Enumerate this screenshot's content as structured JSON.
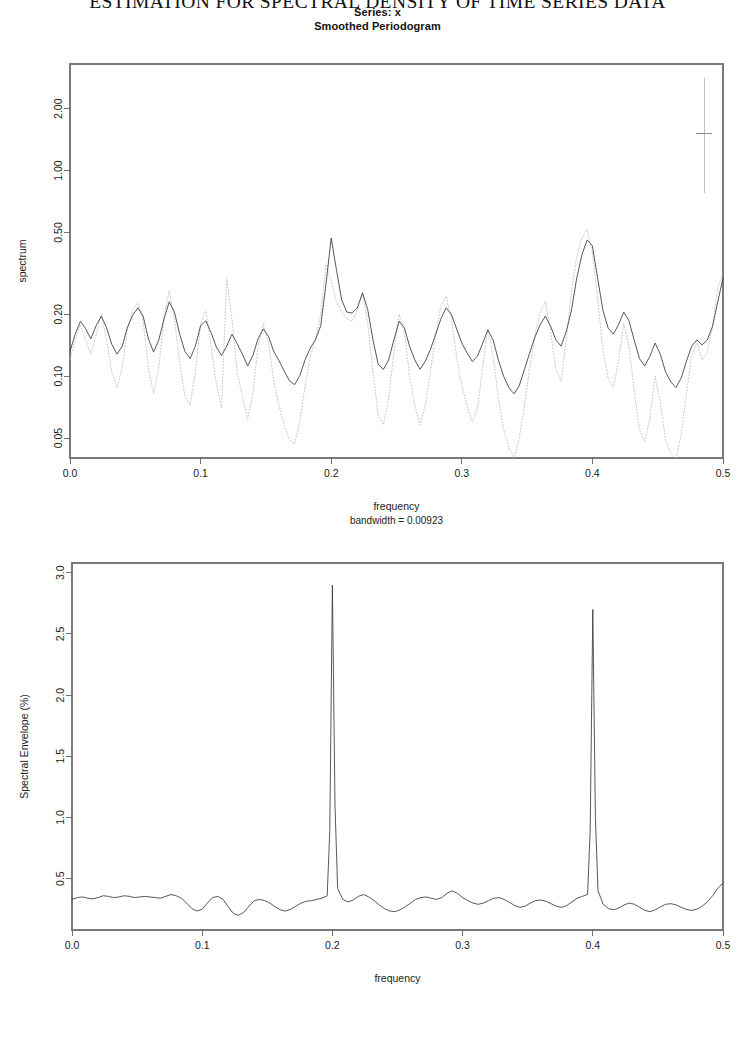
{
  "running_header": "ESTIMATION FOR SPECTRAL DENSITY OF TIME SERIES DATA",
  "figure_title": {
    "line1": "Series: x",
    "line2": "Smoothed Periodogram"
  },
  "chart_data": [
    {
      "id": "smoothed-periodogram",
      "type": "line",
      "title": "Series: x  /  Smoothed Periodogram",
      "xlabel": "frequency",
      "ylabel": "spectrum",
      "subnote": "bandwidth = 0.00923",
      "xlim": [
        0.0,
        0.5
      ],
      "xticks": [
        0.0,
        0.1,
        0.2,
        0.3,
        0.4,
        0.5
      ],
      "xtick_labels": [
        "0.0",
        "0.1",
        "0.2",
        "0.3",
        "0.4",
        "0.5"
      ],
      "yscale": "log",
      "ylim": [
        0.04,
        3.3
      ],
      "yticks": [
        2.0,
        1.0,
        0.5,
        0.2,
        0.1,
        0.05
      ],
      "ytick_labels": [
        "2.00",
        "1.00",
        "0.50",
        "0.20",
        "0.10",
        "0.05"
      ],
      "grid": false,
      "legend": "none",
      "confidence_bar": {
        "x": 0.4855,
        "lower": 0.78,
        "upper": 2.82,
        "center": 1.52
      },
      "series": [
        {
          "name": "smoothed spectrum",
          "style": "solid",
          "color": "#3a3a3a",
          "x": [
            0.0,
            0.004,
            0.008,
            0.012,
            0.016,
            0.02,
            0.024,
            0.028,
            0.032,
            0.036,
            0.04,
            0.044,
            0.048,
            0.052,
            0.056,
            0.06,
            0.064,
            0.068,
            0.072,
            0.076,
            0.08,
            0.084,
            0.088,
            0.092,
            0.096,
            0.1,
            0.104,
            0.108,
            0.112,
            0.116,
            0.12,
            0.124,
            0.128,
            0.132,
            0.136,
            0.14,
            0.144,
            0.148,
            0.152,
            0.156,
            0.16,
            0.164,
            0.168,
            0.172,
            0.176,
            0.18,
            0.184,
            0.188,
            0.192,
            0.196,
            0.2,
            0.204,
            0.208,
            0.212,
            0.216,
            0.22,
            0.224,
            0.228,
            0.232,
            0.236,
            0.24,
            0.244,
            0.248,
            0.252,
            0.256,
            0.26,
            0.264,
            0.268,
            0.272,
            0.276,
            0.28,
            0.284,
            0.288,
            0.292,
            0.296,
            0.3,
            0.304,
            0.308,
            0.312,
            0.316,
            0.32,
            0.324,
            0.328,
            0.332,
            0.336,
            0.34,
            0.344,
            0.348,
            0.352,
            0.356,
            0.36,
            0.364,
            0.368,
            0.372,
            0.376,
            0.38,
            0.384,
            0.388,
            0.392,
            0.396,
            0.4,
            0.404,
            0.408,
            0.412,
            0.416,
            0.42,
            0.424,
            0.428,
            0.432,
            0.436,
            0.44,
            0.444,
            0.448,
            0.452,
            0.456,
            0.46,
            0.464,
            0.468,
            0.472,
            0.476,
            0.48,
            0.484,
            0.488,
            0.492,
            0.496,
            0.5
          ],
          "y": [
            0.132,
            0.16,
            0.185,
            0.17,
            0.152,
            0.176,
            0.196,
            0.172,
            0.143,
            0.128,
            0.14,
            0.173,
            0.198,
            0.215,
            0.196,
            0.152,
            0.131,
            0.15,
            0.19,
            0.23,
            0.205,
            0.16,
            0.132,
            0.122,
            0.14,
            0.176,
            0.186,
            0.163,
            0.139,
            0.126,
            0.14,
            0.16,
            0.144,
            0.128,
            0.112,
            0.126,
            0.152,
            0.17,
            0.156,
            0.132,
            0.119,
            0.106,
            0.095,
            0.091,
            0.101,
            0.12,
            0.137,
            0.151,
            0.176,
            0.28,
            0.47,
            0.33,
            0.235,
            0.205,
            0.203,
            0.215,
            0.255,
            0.21,
            0.15,
            0.114,
            0.108,
            0.12,
            0.15,
            0.185,
            0.172,
            0.14,
            0.12,
            0.108,
            0.118,
            0.135,
            0.16,
            0.19,
            0.215,
            0.2,
            0.17,
            0.145,
            0.13,
            0.118,
            0.125,
            0.145,
            0.168,
            0.15,
            0.12,
            0.1,
            0.088,
            0.082,
            0.09,
            0.108,
            0.13,
            0.155,
            0.178,
            0.196,
            0.175,
            0.15,
            0.14,
            0.165,
            0.21,
            0.3,
            0.39,
            0.46,
            0.43,
            0.3,
            0.21,
            0.172,
            0.16,
            0.178,
            0.205,
            0.186,
            0.15,
            0.122,
            0.112,
            0.125,
            0.145,
            0.128,
            0.105,
            0.094,
            0.088,
            0.098,
            0.118,
            0.14,
            0.15,
            0.142,
            0.15,
            0.175,
            0.23,
            0.3
          ]
        },
        {
          "name": "raw periodogram",
          "style": "dotted",
          "color": "#b6b6b6",
          "x": [
            0.0,
            0.004,
            0.008,
            0.012,
            0.016,
            0.02,
            0.024,
            0.028,
            0.032,
            0.036,
            0.04,
            0.044,
            0.048,
            0.052,
            0.056,
            0.06,
            0.064,
            0.068,
            0.072,
            0.076,
            0.08,
            0.084,
            0.088,
            0.092,
            0.096,
            0.1,
            0.104,
            0.108,
            0.112,
            0.116,
            0.12,
            0.124,
            0.128,
            0.132,
            0.136,
            0.14,
            0.144,
            0.148,
            0.152,
            0.156,
            0.16,
            0.164,
            0.168,
            0.172,
            0.176,
            0.18,
            0.184,
            0.188,
            0.192,
            0.196,
            0.2,
            0.204,
            0.208,
            0.212,
            0.216,
            0.22,
            0.224,
            0.228,
            0.232,
            0.236,
            0.24,
            0.244,
            0.248,
            0.252,
            0.256,
            0.26,
            0.264,
            0.268,
            0.272,
            0.276,
            0.28,
            0.284,
            0.288,
            0.292,
            0.296,
            0.3,
            0.304,
            0.308,
            0.312,
            0.316,
            0.32,
            0.324,
            0.328,
            0.332,
            0.336,
            0.34,
            0.344,
            0.348,
            0.352,
            0.356,
            0.36,
            0.364,
            0.368,
            0.372,
            0.376,
            0.38,
            0.384,
            0.388,
            0.392,
            0.396,
            0.4,
            0.404,
            0.408,
            0.412,
            0.416,
            0.42,
            0.424,
            0.428,
            0.432,
            0.436,
            0.44,
            0.444,
            0.448,
            0.452,
            0.456,
            0.46,
            0.464,
            0.468,
            0.472,
            0.476,
            0.48,
            0.484,
            0.488,
            0.492,
            0.496,
            0.5
          ],
          "y": [
            0.12,
            0.15,
            0.178,
            0.15,
            0.128,
            0.16,
            0.2,
            0.15,
            0.105,
            0.088,
            0.11,
            0.17,
            0.21,
            0.23,
            0.185,
            0.11,
            0.082,
            0.11,
            0.195,
            0.26,
            0.19,
            0.115,
            0.08,
            0.072,
            0.105,
            0.18,
            0.21,
            0.14,
            0.092,
            0.07,
            0.3,
            0.19,
            0.105,
            0.08,
            0.062,
            0.082,
            0.14,
            0.18,
            0.145,
            0.095,
            0.072,
            0.058,
            0.049,
            0.047,
            0.06,
            0.09,
            0.125,
            0.15,
            0.2,
            0.35,
            0.29,
            0.23,
            0.205,
            0.19,
            0.185,
            0.21,
            0.25,
            0.18,
            0.105,
            0.065,
            0.058,
            0.078,
            0.13,
            0.2,
            0.165,
            0.1,
            0.072,
            0.058,
            0.072,
            0.105,
            0.16,
            0.22,
            0.245,
            0.19,
            0.125,
            0.09,
            0.072,
            0.06,
            0.07,
            0.11,
            0.17,
            0.125,
            0.078,
            0.055,
            0.045,
            0.04,
            0.05,
            0.072,
            0.11,
            0.158,
            0.205,
            0.23,
            0.165,
            0.108,
            0.095,
            0.15,
            0.26,
            0.38,
            0.47,
            0.52,
            0.4,
            0.24,
            0.135,
            0.098,
            0.088,
            0.118,
            0.18,
            0.14,
            0.085,
            0.055,
            0.048,
            0.062,
            0.1,
            0.075,
            0.049,
            0.042,
            0.04,
            0.052,
            0.082,
            0.125,
            0.145,
            0.12,
            0.13,
            0.175,
            0.27,
            0.32
          ]
        }
      ]
    },
    {
      "id": "spectral-envelope",
      "type": "line",
      "title": "",
      "xlabel": "frequency",
      "ylabel": "Spectral Envelope (%)",
      "xlim": [
        0.0,
        0.5
      ],
      "xticks": [
        0.0,
        0.1,
        0.2,
        0.3,
        0.4,
        0.5
      ],
      "xtick_labels": [
        "0.0",
        "0.1",
        "0.2",
        "0.3",
        "0.4",
        "0.5"
      ],
      "yscale": "linear",
      "ylim": [
        0.08,
        3.08
      ],
      "yticks": [
        0.5,
        1.0,
        1.5,
        2.0,
        2.5,
        3.0
      ],
      "ytick_labels": [
        "0.5",
        "1.0",
        "1.5",
        "2.0",
        "2.5",
        "3.0"
      ],
      "grid": false,
      "legend": "none",
      "peaks": [
        {
          "frequency": 0.2,
          "value": 2.9
        },
        {
          "frequency": 0.4,
          "value": 2.7
        }
      ],
      "series": [
        {
          "name": "spectral envelope",
          "style": "solid",
          "color": "#3a3a3a",
          "x": [
            0.0,
            0.004,
            0.008,
            0.012,
            0.016,
            0.02,
            0.024,
            0.028,
            0.032,
            0.036,
            0.04,
            0.044,
            0.048,
            0.052,
            0.056,
            0.06,
            0.064,
            0.068,
            0.072,
            0.076,
            0.08,
            0.084,
            0.088,
            0.092,
            0.096,
            0.1,
            0.104,
            0.108,
            0.112,
            0.116,
            0.12,
            0.124,
            0.128,
            0.132,
            0.136,
            0.14,
            0.144,
            0.148,
            0.152,
            0.156,
            0.16,
            0.164,
            0.168,
            0.172,
            0.176,
            0.18,
            0.184,
            0.188,
            0.192,
            0.196,
            0.198,
            0.2,
            0.202,
            0.204,
            0.208,
            0.212,
            0.216,
            0.22,
            0.224,
            0.228,
            0.232,
            0.236,
            0.24,
            0.244,
            0.248,
            0.252,
            0.256,
            0.26,
            0.264,
            0.268,
            0.272,
            0.276,
            0.28,
            0.284,
            0.288,
            0.292,
            0.296,
            0.3,
            0.304,
            0.308,
            0.312,
            0.316,
            0.32,
            0.324,
            0.328,
            0.332,
            0.336,
            0.34,
            0.344,
            0.348,
            0.352,
            0.356,
            0.36,
            0.364,
            0.368,
            0.372,
            0.376,
            0.38,
            0.384,
            0.388,
            0.392,
            0.396,
            0.398,
            0.4,
            0.402,
            0.404,
            0.408,
            0.412,
            0.416,
            0.42,
            0.424,
            0.428,
            0.432,
            0.436,
            0.44,
            0.444,
            0.448,
            0.452,
            0.456,
            0.46,
            0.464,
            0.468,
            0.472,
            0.476,
            0.48,
            0.484,
            0.488,
            0.492,
            0.496,
            0.5
          ],
          "y": [
            0.33,
            0.345,
            0.35,
            0.34,
            0.335,
            0.345,
            0.36,
            0.355,
            0.345,
            0.35,
            0.36,
            0.355,
            0.345,
            0.35,
            0.355,
            0.35,
            0.345,
            0.34,
            0.355,
            0.37,
            0.36,
            0.34,
            0.3,
            0.255,
            0.235,
            0.25,
            0.3,
            0.345,
            0.355,
            0.33,
            0.27,
            0.215,
            0.2,
            0.225,
            0.275,
            0.32,
            0.33,
            0.32,
            0.3,
            0.27,
            0.245,
            0.235,
            0.25,
            0.275,
            0.3,
            0.315,
            0.32,
            0.33,
            0.34,
            0.36,
            0.9,
            2.9,
            1.1,
            0.42,
            0.33,
            0.31,
            0.325,
            0.355,
            0.37,
            0.35,
            0.32,
            0.285,
            0.255,
            0.235,
            0.23,
            0.245,
            0.27,
            0.3,
            0.33,
            0.345,
            0.35,
            0.34,
            0.33,
            0.345,
            0.38,
            0.4,
            0.38,
            0.345,
            0.32,
            0.3,
            0.29,
            0.3,
            0.32,
            0.34,
            0.345,
            0.33,
            0.305,
            0.28,
            0.265,
            0.275,
            0.3,
            0.32,
            0.325,
            0.315,
            0.295,
            0.275,
            0.265,
            0.28,
            0.31,
            0.34,
            0.355,
            0.37,
            0.9,
            2.7,
            1.0,
            0.4,
            0.29,
            0.255,
            0.245,
            0.26,
            0.285,
            0.3,
            0.29,
            0.265,
            0.24,
            0.23,
            0.245,
            0.27,
            0.29,
            0.295,
            0.285,
            0.265,
            0.248,
            0.24,
            0.25,
            0.275,
            0.31,
            0.36,
            0.42,
            0.465
          ]
        }
      ]
    }
  ]
}
